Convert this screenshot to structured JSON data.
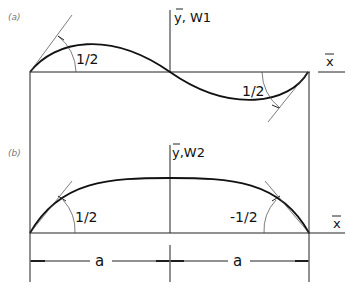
{
  "figure": {
    "panel_a": {
      "label": "(a)",
      "y_axis_label": "y, W1",
      "x_axis_label": "x",
      "angle_left": "1/2",
      "angle_right": "1/2",
      "curve": "antisymmetric (S-shaped) mode, up on left half, down on right half"
    },
    "panel_b": {
      "label": "(b)",
      "y_axis_label": "y,W2",
      "x_axis_label": "x",
      "angle_left": "1/2",
      "angle_right": "-1/2",
      "curve": "symmetric arch mode"
    },
    "dimensions": {
      "left": "a",
      "right": "a"
    },
    "colors": {
      "line": "#111111",
      "background": "#ffffff"
    }
  }
}
